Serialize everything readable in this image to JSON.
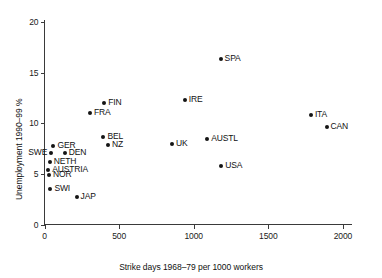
{
  "chart_data": {
    "type": "scatter",
    "title": "",
    "xlabel": "Strike days 1968–79 per 1000 workers",
    "ylabel": "Unemployment 1990–99 %",
    "xlim": [
      0,
      2000
    ],
    "ylim": [
      0,
      20
    ],
    "xticks": [
      0,
      500,
      1000,
      1500,
      2000
    ],
    "xtick_labels": [
      "0",
      "500",
      "1000",
      "1500",
      "2000"
    ],
    "yticks": [
      0,
      5,
      10,
      15,
      20
    ],
    "ytick_labels": [
      "0",
      "5",
      "10",
      "15",
      "20"
    ],
    "grid": false,
    "legend": "none",
    "marker_color": "#141414",
    "axis_color": "#3a3a3a",
    "points": [
      {
        "label": "SPA",
        "x": 1180,
        "y": 16.3,
        "label_pos": "right"
      },
      {
        "label": "IRE",
        "x": 940,
        "y": 12.3,
        "label_pos": "right"
      },
      {
        "label": "FIN",
        "x": 400,
        "y": 12.0,
        "label_pos": "right"
      },
      {
        "label": "ITA",
        "x": 1785,
        "y": 10.8,
        "label_pos": "right"
      },
      {
        "label": "FRA",
        "x": 305,
        "y": 11.0,
        "label_pos": "right"
      },
      {
        "label": "CAN",
        "x": 1890,
        "y": 9.6,
        "label_pos": "right"
      },
      {
        "label": "BEL",
        "x": 395,
        "y": 8.6,
        "label_pos": "right"
      },
      {
        "label": "UK",
        "x": 855,
        "y": 8.0,
        "label_pos": "right"
      },
      {
        "label": "AUSTL",
        "x": 1090,
        "y": 8.4,
        "label_pos": "right"
      },
      {
        "label": "NZ",
        "x": 425,
        "y": 7.9,
        "label_pos": "right"
      },
      {
        "label": "GER",
        "x": 60,
        "y": 7.8,
        "label_pos": "right"
      },
      {
        "label": "DEN",
        "x": 135,
        "y": 7.1,
        "label_pos": "right"
      },
      {
        "label": "SWE",
        "x": 45,
        "y": 7.1,
        "label_pos": "left"
      },
      {
        "label": "USA",
        "x": 1185,
        "y": 5.8,
        "label_pos": "right"
      },
      {
        "label": "NETH",
        "x": 35,
        "y": 6.2,
        "label_pos": "right"
      },
      {
        "label": "AUSTRIA",
        "x": 25,
        "y": 5.4,
        "label_pos": "right"
      },
      {
        "label": "NOR",
        "x": 30,
        "y": 4.9,
        "label_pos": "right"
      },
      {
        "label": "SWI",
        "x": 40,
        "y": 3.5,
        "label_pos": "right"
      },
      {
        "label": "JAP",
        "x": 215,
        "y": 2.7,
        "label_pos": "right"
      }
    ]
  }
}
